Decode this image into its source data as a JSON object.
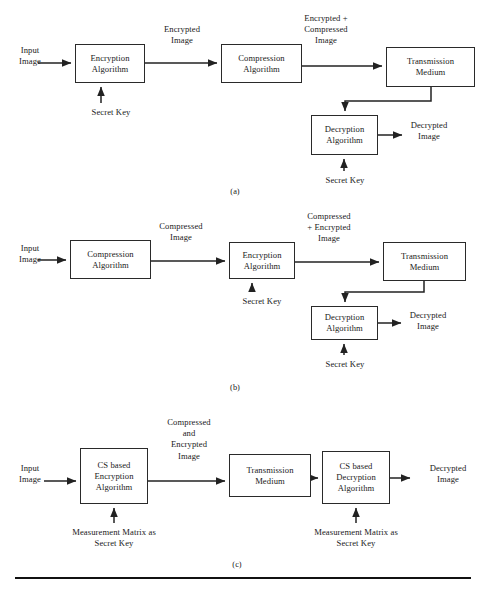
{
  "figure": {
    "panels": [
      {
        "caption": "(a)",
        "caption_pos": {
          "x": 205,
          "y": 187,
          "w": 60
        },
        "nodes": [
          {
            "name": "encryption-algorithm",
            "lines": [
              "Encryption",
              "Algorithm"
            ],
            "x": 75,
            "y": 44,
            "w": 70,
            "h": 39
          },
          {
            "name": "compression-algorithm",
            "lines": [
              "Compression",
              "Algorithm"
            ],
            "x": 221,
            "y": 44,
            "w": 81,
            "h": 39
          },
          {
            "name": "transmission-medium",
            "lines": [
              "Transmission",
              "Medium"
            ],
            "x": 386,
            "y": 47,
            "w": 89,
            "h": 40
          },
          {
            "name": "decryption-algorithm",
            "lines": [
              "Decryption",
              "Algorithm"
            ],
            "x": 311,
            "y": 115,
            "w": 67,
            "h": 40
          }
        ],
        "labels": [
          {
            "name": "input-image-label",
            "lines": [
              "Input",
              "Image"
            ],
            "x": 8,
            "y": 45,
            "w": 44
          },
          {
            "name": "encrypted-image-label",
            "lines": [
              "Encrypted",
              "Image"
            ],
            "x": 146,
            "y": 24,
            "w": 72
          },
          {
            "name": "encrypted-compressed-image-label",
            "lines": [
              "Encrypted +",
              "Compressed",
              "Image"
            ],
            "x": 288,
            "y": 13,
            "w": 76
          },
          {
            "name": "secret-key-label-encryption",
            "lines": [
              "Secret Key"
            ],
            "x": 76,
            "y": 107,
            "w": 70
          },
          {
            "name": "decrypted-image-label",
            "lines": [
              "Decrypted",
              "Image"
            ],
            "x": 393,
            "y": 120,
            "w": 72
          },
          {
            "name": "secret-key-label-decryption",
            "lines": [
              "Secret Key"
            ],
            "x": 310,
            "y": 175,
            "w": 70
          }
        ]
      },
      {
        "caption": "(b)",
        "caption_pos": {
          "x": 205,
          "y": 383,
          "w": 60
        },
        "nodes": [
          {
            "name": "compression-algorithm",
            "lines": [
              "Compression",
              "Algorithm"
            ],
            "x": 70,
            "y": 240,
            "w": 81,
            "h": 39
          },
          {
            "name": "encryption-algorithm",
            "lines": [
              "Encryption",
              "Algorithm"
            ],
            "x": 229,
            "y": 242,
            "w": 66,
            "h": 37
          },
          {
            "name": "transmission-medium",
            "lines": [
              "Transmission",
              "Medium"
            ],
            "x": 383,
            "y": 242,
            "w": 83,
            "h": 39
          },
          {
            "name": "decryption-algorithm",
            "lines": [
              "Decryption",
              "Algorithm"
            ],
            "x": 311,
            "y": 306,
            "w": 67,
            "h": 34
          }
        ],
        "labels": [
          {
            "name": "input-image-label",
            "lines": [
              "Input",
              "Image"
            ],
            "x": 8,
            "y": 243,
            "w": 44
          },
          {
            "name": "compressed-image-label",
            "lines": [
              "Compressed",
              "Image"
            ],
            "x": 142,
            "y": 221,
            "w": 78
          },
          {
            "name": "compressed-encrypted-image-label",
            "lines": [
              "Compressed",
              "+ Encrypted",
              "Image"
            ],
            "x": 290,
            "y": 211,
            "w": 78
          },
          {
            "name": "secret-key-label-encryption",
            "lines": [
              "Secret Key"
            ],
            "x": 227,
            "y": 296,
            "w": 70
          },
          {
            "name": "decrypted-image-label",
            "lines": [
              "Decrypted",
              "Image"
            ],
            "x": 392,
            "y": 310,
            "w": 72
          },
          {
            "name": "secret-key-label-decryption",
            "lines": [
              "Secret Key"
            ],
            "x": 310,
            "y": 359,
            "w": 70
          }
        ]
      },
      {
        "caption": "(c)",
        "caption_pos": {
          "x": 207,
          "y": 560,
          "w": 60
        },
        "nodes": [
          {
            "name": "cs-based-encryption-algorithm",
            "lines": [
              "CS based",
              "Encryption",
              "Algorithm"
            ],
            "x": 80,
            "y": 448,
            "w": 68,
            "h": 56
          },
          {
            "name": "transmission-medium",
            "lines": [
              "Transmission",
              "Medium"
            ],
            "x": 229,
            "y": 454,
            "w": 82,
            "h": 43
          },
          {
            "name": "cs-based-decryption-algorithm",
            "lines": [
              "CS based",
              "Decryption",
              "Algorithm"
            ],
            "x": 322,
            "y": 451,
            "w": 68,
            "h": 53
          }
        ],
        "labels": [
          {
            "name": "input-image-label",
            "lines": [
              "Input",
              "Image"
            ],
            "x": 8,
            "y": 463,
            "w": 44
          },
          {
            "name": "compressed-and-encrypted-image-label",
            "lines": [
              "Compressed",
              "and",
              "Encrypted",
              "Image"
            ],
            "x": 150,
            "y": 417,
            "w": 78
          },
          {
            "name": "measurement-matrix-secret-key-encryption",
            "lines": [
              "Measurement Matrix as",
              "Secret Key"
            ],
            "x": 40,
            "y": 527,
            "w": 148
          },
          {
            "name": "measurement-matrix-secret-key-decryption",
            "lines": [
              "Measurement Matrix as",
              "Secret Key"
            ],
            "x": 282,
            "y": 527,
            "w": 148
          },
          {
            "name": "decrypted-image-label",
            "lines": [
              "Decrypted",
              "Image"
            ],
            "x": 415,
            "y": 463,
            "w": 66
          }
        ]
      }
    ],
    "footer_rule": {
      "x": 15,
      "y": 577,
      "w": 456
    }
  },
  "connectors": [
    {
      "name": "conn-a-input-to-encryption",
      "d": "M 38 63 L 71 63",
      "arrow": "end"
    },
    {
      "name": "conn-a-encryption-to-compression",
      "d": "M 145 63 L 217 63",
      "arrow": "end"
    },
    {
      "name": "conn-a-compression-to-transmission",
      "d": "M 302 66 L 382 66",
      "arrow": "end"
    },
    {
      "name": "conn-a-secretkey-to-encryption",
      "d": "M 101 103 L 101 87",
      "arrow": "end"
    },
    {
      "name": "conn-a-transmission-to-decryption",
      "d": "M 431 87 L 431 101 L 345 101 L 345 111",
      "arrow": "end"
    },
    {
      "name": "conn-a-decryption-to-output",
      "d": "M 378 135 L 402 135",
      "arrow": "end"
    },
    {
      "name": "conn-a-secretkey-to-decryption",
      "d": "M 344 171 L 344 159",
      "arrow": "end"
    },
    {
      "name": "conn-b-input-to-compression",
      "d": "M 38 260 L 66 260",
      "arrow": "end"
    },
    {
      "name": "conn-b-compression-to-encryption",
      "d": "M 151 261 L 225 261",
      "arrow": "end"
    },
    {
      "name": "conn-b-encryption-to-transmission",
      "d": "M 295 262 L 379 262",
      "arrow": "end"
    },
    {
      "name": "conn-b-secretkey-to-encryption",
      "d": "M 252 292 L 252 283",
      "arrow": "end"
    },
    {
      "name": "conn-b-transmission-to-decryption",
      "d": "M 424 281 L 424 292 L 345 292 L 345 302",
      "arrow": "end"
    },
    {
      "name": "conn-b-decryption-to-output",
      "d": "M 378 323 L 401 323",
      "arrow": "end"
    },
    {
      "name": "conn-b-secretkey-to-decryption",
      "d": "M 344 355 L 344 344",
      "arrow": "end"
    },
    {
      "name": "conn-c-input-to-encryption",
      "d": "M 44 481 L 76 481",
      "arrow": "end"
    },
    {
      "name": "conn-c-encryption-to-transmission",
      "d": "M 148 481 L 225 481",
      "arrow": "end"
    },
    {
      "name": "conn-c-transmission-to-decryption",
      "d": "M 311 478 L 318 478",
      "arrow": "end"
    },
    {
      "name": "conn-c-decryption-to-output",
      "d": "M 390 478 L 410 478",
      "arrow": "end"
    },
    {
      "name": "conn-c-secretkey-to-encryption",
      "d": "M 114 523 L 114 508",
      "arrow": "end"
    },
    {
      "name": "conn-c-secretkey-to-decryption",
      "d": "M 356 523 L 356 508",
      "arrow": "end"
    }
  ],
  "style": {
    "stroke": "#222222",
    "box_border": "#2a2a2a",
    "background": "#ffffff"
  }
}
